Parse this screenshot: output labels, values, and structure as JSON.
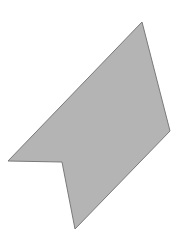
{
  "canvas": {
    "width": 182,
    "height": 252,
    "background": "#ffffff"
  },
  "shape": {
    "type": "polygon",
    "description": "notched arrow-like concave pentagon",
    "points": [
      [
        142,
        22
      ],
      [
        170,
        131
      ],
      [
        75,
        229
      ],
      [
        62,
        162
      ],
      [
        8,
        161
      ]
    ],
    "fill": "#b4b4b4",
    "stroke": "#7a7a7a",
    "stroke_width": 1
  }
}
